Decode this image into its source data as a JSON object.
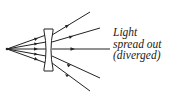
{
  "diagram": {
    "label": {
      "line1": "Light",
      "line2": "spread out",
      "line3": "(diverged)"
    },
    "colors": {
      "stroke": "#222222",
      "background": "#ffffff"
    },
    "elements": [
      "light-source-point",
      "concave-lens",
      "ray-1",
      "ray-2",
      "ray-3",
      "ray-4",
      "ray-5"
    ]
  }
}
